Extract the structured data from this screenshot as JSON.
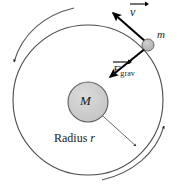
{
  "figure": {
    "type": "physics-diagram",
    "background_color": "#ffffff",
    "stroke_color": "#3a3a3a",
    "vector_color": "#000000",
    "body_fill_color": "#c9c9c9"
  },
  "labels": {
    "central_mass": "M",
    "orbiting_mass": "m",
    "radius_word": "Radius",
    "radius_symbol": "r",
    "velocity_symbol": "v",
    "force_symbol": "F",
    "force_subscript": "grav"
  },
  "elements": {
    "orbit_circle": {
      "name": "orbit-path",
      "center_x": 88,
      "center_y": 100,
      "radius": 75
    },
    "central_body": {
      "name": "central-mass-M",
      "center_x": 88,
      "center_y": 102,
      "radius": 20,
      "fill": "#cbcbcb"
    },
    "orbiting_body": {
      "name": "orbiting-mass-m",
      "center_x": 148,
      "center_y": 45,
      "radius": 6,
      "fill": "#b8b8b8"
    },
    "velocity_vector": {
      "name": "velocity-vector",
      "from_x": 148,
      "from_y": 45,
      "to_x": 113,
      "to_y": 13
    },
    "gravity_vector": {
      "name": "gravity-force-vector",
      "from_x": 148,
      "from_y": 45,
      "to_x": 110,
      "to_y": 76
    },
    "radius_line": {
      "name": "radius-indicator",
      "from_x": 93,
      "from_y": 107,
      "to_x": 136,
      "to_y": 146
    },
    "rotation_arc_left": {
      "name": "rotation-arc-left",
      "direction": "counterclockwise",
      "arrow_tip_x": 12,
      "arrow_tip_y": 57
    },
    "rotation_arc_right": {
      "name": "rotation-arc-right",
      "direction": "counterclockwise",
      "arrow_tip_x": 166,
      "arrow_tip_y": 128
    }
  }
}
